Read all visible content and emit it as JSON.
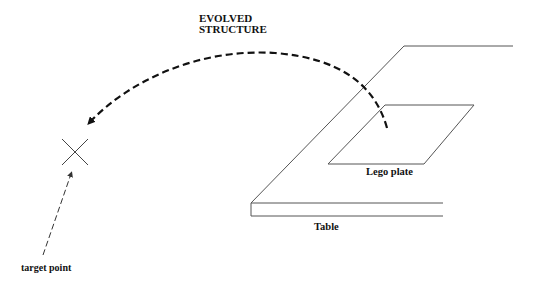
{
  "diagram": {
    "labels": {
      "evolved_line1": "EVOLVED",
      "evolved_line2": "STRUCTURE",
      "lego_plate": "Lego plate",
      "table": "Table",
      "target_point": "target point"
    },
    "elements": {
      "table_surface": "parallelogram table top in perspective",
      "lego_plate": "parallelogram plate on table",
      "evolved_structure_arc": "thick dashed curved arrow from lego plate to target",
      "target_marker": "X cross",
      "target_pointer": "thin dashed arrow from label to target"
    },
    "colors": {
      "line": "#555555",
      "ink": "#111111",
      "background": "#ffffff"
    }
  }
}
